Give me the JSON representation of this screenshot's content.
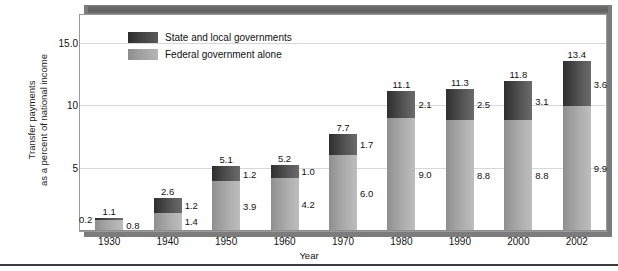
{
  "chart_data": {
    "type": "bar",
    "subtype": "stacked-vertical",
    "title": "",
    "xlabel": "Year",
    "ylabel": "Transfer payments as a percent of national income",
    "ylabel_lines": [
      "Transfer payments",
      "as a percent of national income"
    ],
    "categories": [
      "1930",
      "1940",
      "1950",
      "1960",
      "1970",
      "1980",
      "1990",
      "2000",
      "2002"
    ],
    "series": [
      {
        "name": "Federal government alone",
        "values": [
          0.8,
          1.4,
          3.9,
          4.2,
          6.0,
          9.0,
          8.8,
          8.8,
          9.9
        ]
      },
      {
        "name": "State and local governments",
        "values": [
          0.2,
          1.2,
          1.2,
          1.0,
          1.7,
          2.1,
          2.5,
          3.1,
          3.6
        ]
      }
    ],
    "totals": [
      1.1,
      2.6,
      5.1,
      5.2,
      7.7,
      11.1,
      11.3,
      11.8,
      13.4
    ],
    "ylim": [
      0,
      17.2
    ],
    "yticks": [
      "5",
      "10",
      "15.0"
    ],
    "ytick_values": [
      5,
      10,
      15
    ],
    "grid": true,
    "legend_position": "top-left",
    "colors": {
      "state_and_local": "#3a3a3a",
      "federal": "#a0a0a0",
      "gridline": "#d7d7d7",
      "frame": "#6e6e6e",
      "text": "#111111"
    }
  },
  "legend": {
    "items": [
      {
        "label": "State and local governments",
        "key": "state"
      },
      {
        "label": "Federal government alone",
        "key": "federal"
      }
    ]
  },
  "axes": {
    "x_title": "Year",
    "y_title_line1": "Transfer payments",
    "y_title_line2": "as a percent of national income",
    "y_ticks": [
      "15.0",
      "10",
      "5"
    ],
    "x_ticks": [
      "1930",
      "1940",
      "1950",
      "1960",
      "1970",
      "1980",
      "1990",
      "2000",
      "2002"
    ]
  },
  "bars": [
    {
      "year": "1930",
      "total": "1.1",
      "state": "0.2",
      "federal": "0.8",
      "state_label_side": "left"
    },
    {
      "year": "1940",
      "total": "2.6",
      "state": "1.2",
      "federal": "1.4",
      "state_label_side": "right"
    },
    {
      "year": "1950",
      "total": "5.1",
      "state": "1.2",
      "federal": "3.9",
      "state_label_side": "right"
    },
    {
      "year": "1960",
      "total": "5.2",
      "state": "1.0",
      "federal": "4.2",
      "state_label_side": "right"
    },
    {
      "year": "1970",
      "total": "7.7",
      "state": "1.7",
      "federal": "6.0",
      "state_label_side": "right"
    },
    {
      "year": "1980",
      "total": "11.1",
      "state": "2.1",
      "federal": "9.0",
      "state_label_side": "right"
    },
    {
      "year": "1990",
      "total": "11.3",
      "state": "2.5",
      "federal": "8.8",
      "state_label_side": "right"
    },
    {
      "year": "2000",
      "total": "11.8",
      "state": "3.1",
      "federal": "8.8",
      "state_label_side": "right"
    },
    {
      "year": "2002",
      "total": "13.4",
      "state": "3.6",
      "federal": "9.9",
      "state_label_side": "right"
    }
  ]
}
